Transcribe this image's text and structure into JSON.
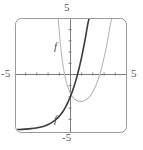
{
  "figure": {
    "name": "graph-of-f-and-f-prime",
    "width": 143,
    "height": 150,
    "background_color": "#ffffff"
  },
  "frame": {
    "name": "plot-frame",
    "x": 15,
    "y": 18,
    "width": 112,
    "height": 115,
    "corner_radius": 6,
    "stroke_color": "#9a9a9a",
    "stroke_width": 1
  },
  "axes": {
    "origin_px": {
      "x": 70,
      "y": 74
    },
    "unit_px": 11.2,
    "axis_color": "#6e6e6e",
    "tick_length": 3,
    "x_axis_label_left": "-5",
    "x_axis_label_right": "5",
    "y_axis_label_top": "5",
    "y_axis_label_bottom": "-5",
    "x_ticks": [
      -4,
      -3,
      -2,
      -1,
      1,
      2,
      3,
      4
    ],
    "y_ticks": [
      -4,
      -3,
      -2,
      -1,
      1,
      2,
      3,
      4
    ]
  },
  "curve_labels": {
    "f": "f",
    "f_prime": "f′"
  },
  "chart_data": {
    "type": "line",
    "title": "",
    "xlabel": "",
    "ylabel": "",
    "xlim": [
      -5,
      5
    ],
    "ylim": [
      -5,
      5
    ],
    "grid": false,
    "legend": "inline-curve-labels",
    "x_tick_labels": [
      "-5",
      "5"
    ],
    "y_tick_labels": [
      "5",
      "-5"
    ],
    "series": [
      {
        "name": "f",
        "label": "f",
        "color": "#b9b9b9",
        "width": 1.1,
        "description": "cubic-like curve: steeply descending from upper left, local minimum near (1.4, -2.3), then rising steeply off the top right",
        "points": [
          [
            -1.05,
            5.0
          ],
          [
            -1.0,
            4.3
          ],
          [
            -0.95,
            3.7
          ],
          [
            -0.9,
            3.1
          ],
          [
            -0.85,
            2.6
          ],
          [
            -0.8,
            2.1
          ],
          [
            -0.75,
            1.7
          ],
          [
            -0.7,
            1.3
          ],
          [
            -0.6,
            0.62
          ],
          [
            -0.5,
            0.05
          ],
          [
            -0.4,
            -0.42
          ],
          [
            -0.3,
            -0.82
          ],
          [
            -0.2,
            -1.15
          ],
          [
            -0.1,
            -1.43
          ],
          [
            0.0,
            -1.66
          ],
          [
            0.15,
            -1.94
          ],
          [
            0.3,
            -2.13
          ],
          [
            0.45,
            -2.27
          ],
          [
            0.6,
            -2.36
          ],
          [
            0.8,
            -2.42
          ],
          [
            1.0,
            -2.44
          ],
          [
            1.2,
            -2.41
          ],
          [
            1.4,
            -2.33
          ],
          [
            1.6,
            -2.18
          ],
          [
            1.8,
            -1.96
          ],
          [
            2.0,
            -1.66
          ],
          [
            2.2,
            -1.28
          ],
          [
            2.4,
            -0.8
          ],
          [
            2.6,
            -0.22
          ],
          [
            2.8,
            0.47
          ],
          [
            3.0,
            1.28
          ],
          [
            3.2,
            2.2
          ],
          [
            3.4,
            3.24
          ],
          [
            3.6,
            4.4
          ],
          [
            3.75,
            5.0
          ]
        ]
      },
      {
        "name": "f-prime",
        "label": "f′",
        "color": "#3a3a3a",
        "width": 1.6,
        "description": "exponential-like curve: nearly flat along y = -5 on the left, rising through the origin region and steeply off the top",
        "points": [
          [
            -5.0,
            -4.97
          ],
          [
            -4.5,
            -4.95
          ],
          [
            -4.0,
            -4.92
          ],
          [
            -3.5,
            -4.88
          ],
          [
            -3.0,
            -4.82
          ],
          [
            -2.6,
            -4.74
          ],
          [
            -2.2,
            -4.62
          ],
          [
            -1.9,
            -4.49
          ],
          [
            -1.6,
            -4.32
          ],
          [
            -1.3,
            -4.1
          ],
          [
            -1.0,
            -3.82
          ],
          [
            -0.8,
            -3.58
          ],
          [
            -0.6,
            -3.3
          ],
          [
            -0.4,
            -2.96
          ],
          [
            -0.2,
            -2.56
          ],
          [
            0.0,
            -2.1
          ],
          [
            0.2,
            -1.58
          ],
          [
            0.4,
            -0.98
          ],
          [
            0.6,
            -0.3
          ],
          [
            0.8,
            0.47
          ],
          [
            1.0,
            1.33
          ],
          [
            1.2,
            2.3
          ],
          [
            1.4,
            3.36
          ],
          [
            1.6,
            4.52
          ],
          [
            1.72,
            5.0
          ]
        ]
      }
    ]
  }
}
